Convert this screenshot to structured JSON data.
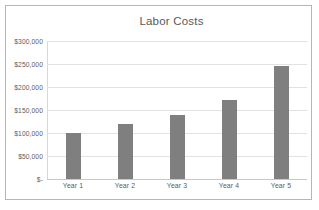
{
  "chart_data": {
    "type": "bar",
    "title": "Labor Costs",
    "xlabel": "",
    "ylabel": "",
    "categories": [
      "Year 1",
      "Year 2",
      "Year 3",
      "Year 4",
      "Year 5"
    ],
    "values": [
      100000,
      120000,
      140000,
      172000,
      245000
    ],
    "series": [
      {
        "name": "Labor Costs",
        "values": [
          100000,
          120000,
          140000,
          172000,
          245000
        ]
      }
    ],
    "ylim": [
      0,
      300000
    ],
    "ytick_values": [
      0,
      50000,
      100000,
      150000,
      200000,
      250000,
      300000
    ],
    "ytick_labels": [
      "$-",
      "$50,000",
      "$100,000",
      "$150,000",
      "$200,000",
      "$250,000",
      "$300,000"
    ],
    "grid": true,
    "legend": false,
    "legend_position": "none",
    "bar_color": "#7f7f7f",
    "gridline_color": "#e2e2e2",
    "text_color": "#5d5d5f",
    "border_color": "#b6b6b6",
    "background_color": "#ffffff"
  }
}
